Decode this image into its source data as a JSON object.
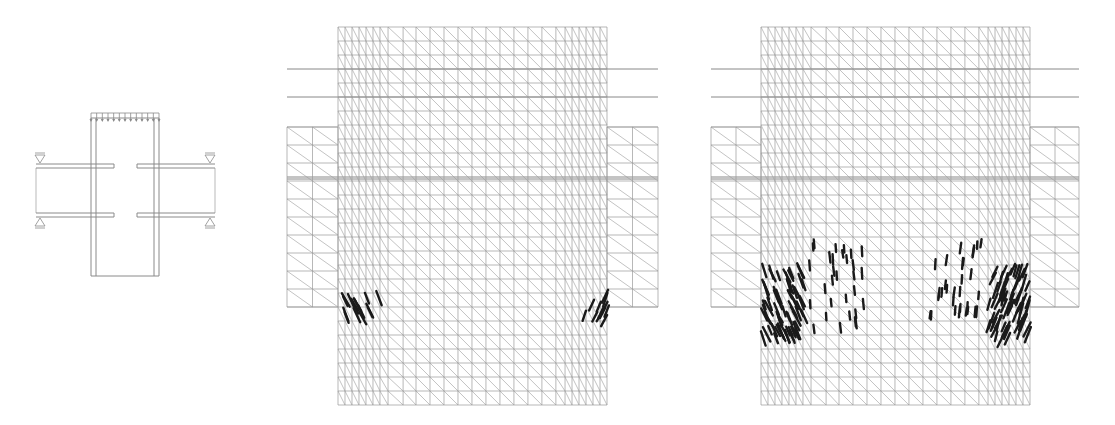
{
  "figure": {
    "panels": [
      {
        "id": "schematic",
        "description": "Beam-column joint schematic with distributed top load and four supports"
      },
      {
        "id": "mesh-1",
        "description": "Finite element mesh with initial cracking at joint corners"
      },
      {
        "id": "mesh-2",
        "description": "Finite element mesh with extended crack pattern"
      }
    ]
  },
  "colors": {
    "mesh_line": "#9a9a9a",
    "mesh_line_strong": "#7a7a7a",
    "crack": "#1a1a1a",
    "schematic": "#8a8a8a"
  },
  "schematic": {
    "column": {
      "x1": 91,
      "x2": 159,
      "y1": 118,
      "y2": 276
    },
    "load_arrows": 13,
    "supports": [
      "top-left",
      "top-right",
      "bottom-left",
      "bottom-right"
    ]
  },
  "meshes": [
    {
      "column": {
        "x1": 338,
        "x2": 607,
        "y1": 27,
        "y2": 405
      },
      "flange": {
        "x1": 287,
        "x2": 658,
        "y1": 127,
        "y2": 307
      },
      "crack_level": "initial"
    },
    {
      "column": {
        "x1": 761,
        "x2": 1030,
        "y1": 27,
        "y2": 405
      },
      "flange": {
        "x1": 711,
        "x2": 1079,
        "y1": 127,
        "y2": 307
      },
      "crack_level": "extended"
    }
  ]
}
